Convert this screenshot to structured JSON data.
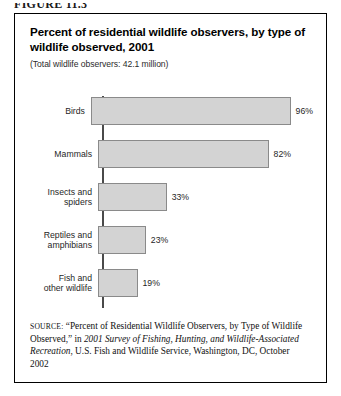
{
  "figure_number": "FIGURE 11.3",
  "figure": {
    "title": "Percent of residential wildlife observers, by type of wildlife observed, 2001",
    "subtitle": "(Total wildlife observers: 42.1 million)"
  },
  "source": {
    "label": "SOURCE:",
    "text_part1": "“Percent of Residential Wildlife Observers, by Type of Wildlife Observed,” in ",
    "title_italic": "2001 Survey of Fishing, Hunting, and Wildlife-Associated Recreation",
    "text_part2": ", U.S. Fish and Wildlife Service, Washington, DC, October 2002"
  },
  "chart_data": {
    "type": "bar",
    "orientation": "horizontal",
    "title": "Percent of residential wildlife observers, by type of wildlife observed, 2001",
    "subtitle": "(Total wildlife observers: 42.1 million)",
    "xlabel": "",
    "ylabel": "",
    "xlim": [
      0,
      100
    ],
    "grid": false,
    "legend": false,
    "categories": [
      "Birds",
      "Mammals",
      "Insects and spiders",
      "Reptiles and amphibians",
      "Fish and other wildlife"
    ],
    "values": [
      96,
      82,
      33,
      23,
      19
    ],
    "value_labels": [
      "96%",
      "82%",
      "33%",
      "23%",
      "19%"
    ],
    "bars": [
      {
        "label": "Birds",
        "label_lines": "Birds",
        "value": 96,
        "value_label": "96%"
      },
      {
        "label": "Mammals",
        "label_lines": "Mammals",
        "value": 82,
        "value_label": "82%"
      },
      {
        "label": "Insects and spiders",
        "label_lines": "Insects and\nspiders",
        "value": 33,
        "value_label": "33%"
      },
      {
        "label": "Reptiles and amphibians",
        "label_lines": "Reptiles and\namphibians",
        "value": 23,
        "value_label": "23%"
      },
      {
        "label": "Fish and other wildlife",
        "label_lines": "Fish and\nother wildlife",
        "value": 19,
        "value_label": "19%"
      }
    ],
    "colors": {
      "bar_fill": "#d3d3d3",
      "bar_border": "#8a8a8a",
      "axis": "#4a4a4a",
      "text": "#1f1f1f",
      "frame": "#000000"
    }
  }
}
